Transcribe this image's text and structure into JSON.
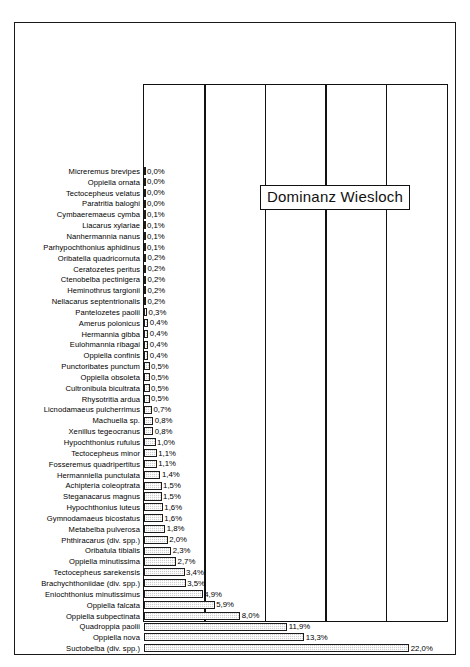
{
  "chart_data": {
    "type": "bar",
    "orientation": "horizontal",
    "title": "Dominanz Wiesloch",
    "xlabel": "",
    "ylabel": "",
    "xlim": [
      0,
      25
    ],
    "grid": true,
    "gridlines": [
      5,
      10,
      15,
      20
    ],
    "value_suffix": "%",
    "decimal_separator": ",",
    "legend": "none",
    "categories": [
      "Micreremus brevipes",
      "Oppiella ornata",
      "Tectocepheus velatus",
      "Paratritia baloghi",
      "Cymbaeremaeus cymba",
      "Liacarus xylariae",
      "Nanhermannia nanus",
      "Parhypochthonius aphidinus",
      "Oribatella quadricornuta",
      "Ceratozetes peritus",
      "Ctenobelba pectinigera",
      "Heminothrus targionii",
      "Nellacarus septentrionalis",
      "Pantelozetes paolii",
      "Amerus polonicus",
      "Hermannia gibba",
      "Eulohmannia ribagai",
      "Oppiella confinis",
      "Punctoribates punctum",
      "Oppiella obsoleta",
      "Cultronibula bicultrata",
      "Rhysotritia ardua",
      "Licnodamaeus pulcherrimus",
      "Machuella sp.",
      "Xenillus tegeocranus",
      "Hypochthonius rufulus",
      "Tectocepheus minor",
      "Fosseremus quadripertitus",
      "Hermanniella punctulata",
      "Achipteria coleoptrata",
      "Steganacarus magnus",
      "Hypochthonius luteus",
      "Gymnodamaeus bicostatus",
      "Metabelba pulverosa",
      "Phthiracarus (div. spp.)",
      "Oribatula tibialis",
      "Oppiella minutissima",
      "Tectocepheus sarekensis",
      "Brachychthoniidae (div. spp.)",
      "Eniochthonius minutissimus",
      "Oppiella falcata",
      "Oppiella subpectinata",
      "Quadroppia paolii",
      "Oppiella nova",
      "Suctobelba (div. spp.)"
    ],
    "values": [
      0.0,
      0.0,
      0.0,
      0.0,
      0.1,
      0.1,
      0.1,
      0.1,
      0.2,
      0.2,
      0.2,
      0.2,
      0.2,
      0.3,
      0.4,
      0.4,
      0.4,
      0.4,
      0.5,
      0.5,
      0.5,
      0.5,
      0.7,
      0.8,
      0.8,
      1.0,
      1.1,
      1.1,
      1.4,
      1.5,
      1.5,
      1.6,
      1.6,
      1.8,
      2.0,
      2.3,
      2.7,
      3.4,
      3.5,
      4.9,
      5.9,
      8.0,
      11.9,
      13.3,
      22.0
    ],
    "value_labels": [
      "0,0%",
      "0,0%",
      "0,0%",
      "0,0%",
      "0,1%",
      "0,1%",
      "0,1%",
      "0,1%",
      "0,2%",
      "0,2%",
      "0,2%",
      "0,2%",
      "0,2%",
      "0,3%",
      "0,4%",
      "0,4%",
      "0,4%",
      "0,4%",
      "0,5%",
      "0,5%",
      "0,5%",
      "0,5%",
      "0,7%",
      "0,8%",
      "0,8%",
      "1,0%",
      "1,1%",
      "1,1%",
      "1,4%",
      "1,5%",
      "1,5%",
      "1,6%",
      "1,6%",
      "1,8%",
      "2,0%",
      "2,3%",
      "2,7%",
      "3,4%",
      "3,5%",
      "4,9%",
      "5,9%",
      "8,0%",
      "11,9%",
      "13,3%",
      "22,0%"
    ],
    "colors": {
      "bar_fill": "#cfcfcf",
      "bar_outline": "#1c1c1c",
      "axis": "#111111",
      "text": "#000000",
      "background": "#ffffff"
    }
  }
}
